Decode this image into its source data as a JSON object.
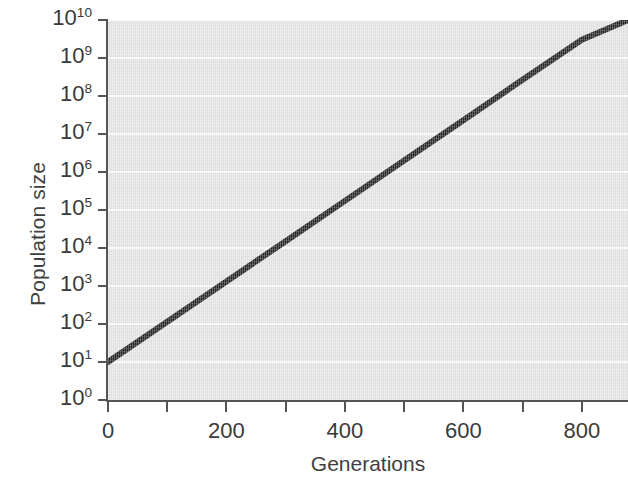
{
  "chart_data": {
    "type": "line",
    "title": "",
    "xlabel": "Generations",
    "ylabel": "Population size",
    "xlim": [
      0,
      878
    ],
    "ylim": [
      1,
      10000000000
    ],
    "yscale": "log",
    "xscale": "linear",
    "grid": true,
    "grid_orientation": "horizontal",
    "grid_color": "#fbfbfb",
    "plot_background_color": "#e5e5e5",
    "line_color": "#262626",
    "line_width_px": 6,
    "legend": null,
    "legend_position": "none",
    "x_ticks": [
      0,
      100,
      200,
      300,
      400,
      500,
      600,
      700,
      800
    ],
    "x_tick_labels": [
      "0",
      "",
      "200",
      "",
      "400",
      "",
      "600",
      "",
      "800"
    ],
    "x_major_tick_labels": [
      "0",
      "200",
      "400",
      "600",
      "800"
    ],
    "y_ticks": [
      1,
      10,
      100,
      1000,
      10000,
      100000,
      1000000,
      10000000,
      100000000,
      1000000000,
      10000000000
    ],
    "y_tick_exponents": [
      0,
      1,
      2,
      3,
      4,
      5,
      6,
      7,
      8,
      9,
      10
    ],
    "y_tick_base": "10",
    "y_tick_labels": [
      "10^0",
      "10^1",
      "10^2",
      "10^3",
      "10^4",
      "10^5",
      "10^6",
      "10^7",
      "10^8",
      "10^9",
      "10^10"
    ],
    "series": [
      {
        "name": "Exponential population growth",
        "x": [
          0,
          100,
          200,
          300,
          400,
          500,
          600,
          700,
          800,
          878
        ],
        "y": [
          10,
          115,
          1320,
          15200,
          175000,
          2010000,
          23100000,
          266000000,
          3050000000,
          10000000000
        ],
        "y_log10": [
          1,
          2.06,
          3.12,
          4.18,
          5.24,
          6.3,
          7.36,
          8.43,
          9.48,
          10.0
        ],
        "start_point": {
          "x": 0,
          "y": 10,
          "label": "10^1"
        },
        "end_point": {
          "x": 878,
          "y": 10000000000,
          "label": "10^10"
        },
        "slope_decades_per_generation": 0.01025
      }
    ]
  },
  "axes": {
    "y_title": "Population size",
    "x_title": "Generations",
    "y_tick_items": [
      {
        "base": "10",
        "exp": "10"
      },
      {
        "base": "10",
        "exp": "9"
      },
      {
        "base": "10",
        "exp": "8"
      },
      {
        "base": "10",
        "exp": "7"
      },
      {
        "base": "10",
        "exp": "6"
      },
      {
        "base": "10",
        "exp": "5"
      },
      {
        "base": "10",
        "exp": "4"
      },
      {
        "base": "10",
        "exp": "3"
      },
      {
        "base": "10",
        "exp": "2"
      },
      {
        "base": "10",
        "exp": "1"
      },
      {
        "base": "10",
        "exp": "0"
      }
    ],
    "x_tick_items": [
      {
        "label": "0",
        "value": 0,
        "major": true
      },
      {
        "label": "",
        "value": 100,
        "major": false
      },
      {
        "label": "200",
        "value": 200,
        "major": true
      },
      {
        "label": "",
        "value": 300,
        "major": false
      },
      {
        "label": "400",
        "value": 400,
        "major": true
      },
      {
        "label": "",
        "value": 500,
        "major": false
      },
      {
        "label": "600",
        "value": 600,
        "major": true
      },
      {
        "label": "",
        "value": 700,
        "major": false
      },
      {
        "label": "800",
        "value": 800,
        "major": true
      }
    ]
  },
  "colors": {
    "plot_background": "#e5e5e5",
    "grid": "#fbfbfb",
    "line": "#262626",
    "axis": "#555555",
    "text": "#3a3a3a",
    "page_background": "#ffffff"
  }
}
